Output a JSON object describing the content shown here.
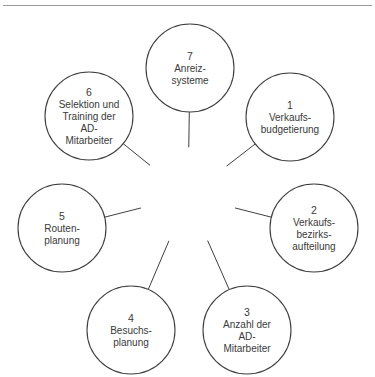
{
  "figure": {
    "top_rule_color": "#9a9a9a",
    "background_color": "#ffffff",
    "line_color": "#3f3f3f",
    "text_color": "#3a3a3a"
  },
  "hub": {
    "label_lines": [
      "Entscheidungs",
      "tatbestände"
    ],
    "fill_color": "#9b9b9b",
    "text_color": "#ffffff",
    "cx": 188,
    "cy": 196,
    "r": 48.5
  },
  "nodes": [
    {
      "number": "1",
      "lines": [
        "Verkaufs-",
        "budgetierung"
      ],
      "cx": 290,
      "cy": 117,
      "r": 44
    },
    {
      "number": "2",
      "lines": [
        "Verkaufs-",
        "bezirks-",
        "aufteilung"
      ],
      "cx": 314,
      "cy": 228,
      "r": 44
    },
    {
      "number": "3",
      "lines": [
        "Anzahl der",
        "AD-",
        "Mitarbeiter"
      ],
      "cx": 247,
      "cy": 330,
      "r": 44
    },
    {
      "number": "4",
      "lines": [
        "Besuchs-",
        "planung"
      ],
      "cx": 131,
      "cy": 330,
      "r": 44
    },
    {
      "number": "5",
      "lines": [
        "Routen-",
        "planung"
      ],
      "cx": 62,
      "cy": 228,
      "r": 44
    },
    {
      "number": "6",
      "lines": [
        "Selektion und",
        "Training der",
        "AD-",
        "Mitarbeiter"
      ],
      "cx": 89,
      "cy": 116,
      "r": 44
    },
    {
      "number": "7",
      "lines": [
        "Anreiz-",
        "systeme"
      ],
      "cx": 190,
      "cy": 68,
      "r": 44
    }
  ]
}
